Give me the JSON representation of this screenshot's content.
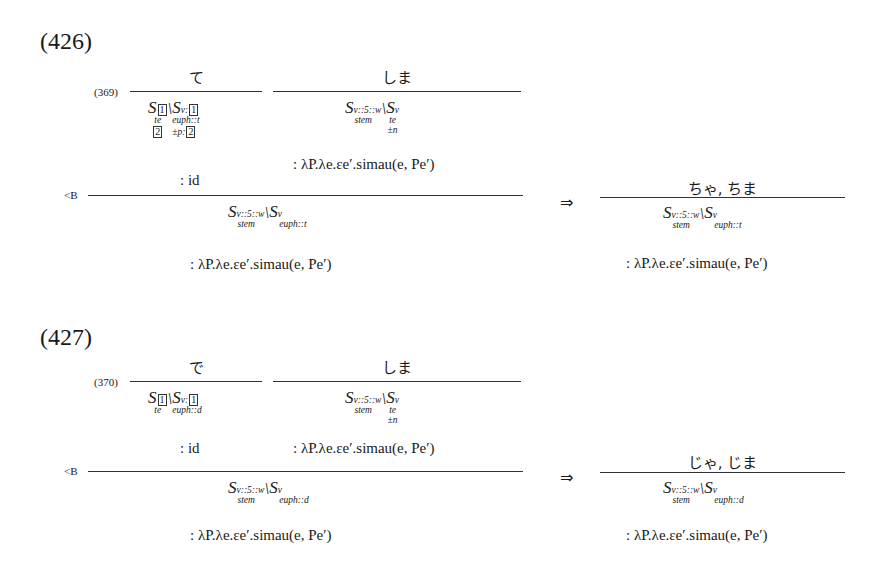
{
  "examples": [
    {
      "number": "(426)",
      "rule_ref": "(369)",
      "left_lex": "て",
      "left_cat": {
        "main": "S",
        "main_box": "1",
        "main_feat": "te",
        "main_box2": "2",
        "arg": "S",
        "arg_sub": "v:",
        "arg_box": "1",
        "arg_feat": "euph::t",
        "arg_feat2": "±p:",
        "arg_box2": "2"
      },
      "left_sem": ": id",
      "right_lex": "しま",
      "right_cat": {
        "main": "S",
        "main_sub": "v::5::w",
        "main_under": "stem",
        "arg": "S",
        "arg_sub": "v",
        "arg_feat": "te",
        "arg_feat2": "±n"
      },
      "right_sem": ": λP.λe.εe′.simau(e, Pe′)",
      "rule_label": "<B",
      "result_cat": {
        "main": "S",
        "main_sub": "v::5::w",
        "main_under": "stem",
        "arg": "S",
        "arg_sub": "v",
        "arg_feat": "euph::t"
      },
      "result_sem": ": λP.λe.εe′.simau(e, Pe′)",
      "arrow": "⇒",
      "contracted_lex": "ちゃ, ちま",
      "contracted_cat": {
        "main": "S",
        "main_sub": "v::5::w",
        "main_under": "stem",
        "arg": "S",
        "arg_sub": "v",
        "arg_feat": "euph::t"
      },
      "contracted_sem": ": λP.λe.εe′.simau(e, Pe′)"
    },
    {
      "number": "(427)",
      "rule_ref": "(370)",
      "left_lex": "で",
      "left_cat": {
        "main": "S",
        "main_box": "1",
        "main_feat": "te",
        "arg": "S",
        "arg_sub": "v:",
        "arg_box": "1",
        "arg_feat": "euph::d"
      },
      "left_sem": ": id",
      "right_lex": "しま",
      "right_cat": {
        "main": "S",
        "main_sub": "v::5::w",
        "main_under": "stem",
        "arg": "S",
        "arg_sub": "v",
        "arg_feat": "te",
        "arg_feat2": "±n"
      },
      "right_sem": ": λP.λe.εe′.simau(e, Pe′)",
      "rule_label": "<B",
      "result_cat": {
        "main": "S",
        "main_sub": "v::5::w",
        "main_under": "stem",
        "arg": "S",
        "arg_sub": "v",
        "arg_feat": "euph::d"
      },
      "result_sem": ": λP.λe.εe′.simau(e, Pe′)",
      "arrow": "⇒",
      "contracted_lex": "じゃ, じま",
      "contracted_cat": {
        "main": "S",
        "main_sub": "v::5::w",
        "main_under": "stem",
        "arg": "S",
        "arg_sub": "v",
        "arg_feat": "euph::d"
      },
      "contracted_sem": ": λP.λe.εe′.simau(e, Pe′)"
    }
  ]
}
